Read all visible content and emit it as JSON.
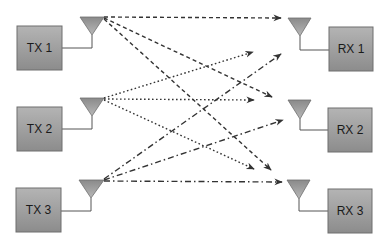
{
  "diagram": {
    "colors": {
      "background": "#ffffff",
      "box_top": "#b4b4b4",
      "box_bottom": "#8c8c8c",
      "box_border": "#6e6e6e",
      "antenna_top": "#8a8a8a",
      "antenna_bottom": "#b8b8b8",
      "link": "#333333",
      "label": "#1a1a1a"
    },
    "transmitters": [
      {
        "id": "tx1",
        "label": "TX 1",
        "box": {
          "x": 17,
          "y": 26,
          "w": 45,
          "h": 44
        },
        "antenna": {
          "x": 80,
          "y": 17,
          "w": 24,
          "h": 18
        },
        "stem_x": 92,
        "feed_y": 48,
        "link_style": "dashed"
      },
      {
        "id": "tx2",
        "label": "TX 2",
        "box": {
          "x": 17,
          "y": 107,
          "w": 45,
          "h": 44
        },
        "antenna": {
          "x": 80,
          "y": 98,
          "w": 24,
          "h": 18
        },
        "stem_x": 92,
        "feed_y": 129,
        "link_style": "dotted"
      },
      {
        "id": "tx3",
        "label": "TX 3",
        "box": {
          "x": 16,
          "y": 188,
          "w": 45,
          "h": 44
        },
        "antenna": {
          "x": 79,
          "y": 180,
          "w": 25,
          "h": 18
        },
        "stem_x": 91,
        "feed_y": 211,
        "link_style": "dashdot"
      }
    ],
    "receivers": [
      {
        "id": "rx1",
        "label": "RX 1",
        "box": {
          "x": 329,
          "y": 27,
          "w": 44,
          "h": 44
        },
        "antenna": {
          "x": 288,
          "y": 18,
          "w": 23,
          "h": 18
        },
        "stem_x": 300,
        "feed_y": 50
      },
      {
        "id": "rx2",
        "label": "RX 2",
        "box": {
          "x": 328,
          "y": 108,
          "w": 44,
          "h": 44
        },
        "antenna": {
          "x": 288,
          "y": 100,
          "w": 23,
          "h": 19
        },
        "stem_x": 300,
        "feed_y": 130
      },
      {
        "id": "rx3",
        "label": "RX 3",
        "box": {
          "x": 328,
          "y": 189,
          "w": 44,
          "h": 44
        },
        "antenna": {
          "x": 287,
          "y": 180,
          "w": 23,
          "h": 19
        },
        "stem_x": 299,
        "feed_y": 211
      }
    ],
    "links": [
      {
        "from": "TX 1",
        "to": "RX 1",
        "style": "dashed",
        "x1": 104,
        "y1": 17,
        "x2": 281,
        "y2": 18
      },
      {
        "from": "TX 1",
        "to": "RX 2",
        "style": "dashed",
        "x1": 104,
        "y1": 18,
        "x2": 272,
        "y2": 97
      },
      {
        "from": "TX 1",
        "to": "RX 3",
        "style": "dashed",
        "x1": 104,
        "y1": 19,
        "x2": 271,
        "y2": 170
      },
      {
        "from": "TX 2",
        "to": "RX 1",
        "style": "dotted",
        "x1": 104,
        "y1": 98,
        "x2": 253,
        "y2": 52
      },
      {
        "from": "TX 2",
        "to": "RX 2",
        "style": "dotted",
        "x1": 104,
        "y1": 99,
        "x2": 254,
        "y2": 100
      },
      {
        "from": "TX 2",
        "to": "RX 3",
        "style": "dotted",
        "x1": 104,
        "y1": 100,
        "x2": 254,
        "y2": 169
      },
      {
        "from": "TX 3",
        "to": "RX 1",
        "style": "dashdot",
        "x1": 104,
        "y1": 179,
        "x2": 281,
        "y2": 54
      },
      {
        "from": "TX 3",
        "to": "RX 2",
        "style": "dashdot",
        "x1": 104,
        "y1": 180,
        "x2": 283,
        "y2": 120
      },
      {
        "from": "TX 3",
        "to": "RX 3",
        "style": "dashdot",
        "x1": 104,
        "y1": 181,
        "x2": 282,
        "y2": 182
      }
    ]
  }
}
